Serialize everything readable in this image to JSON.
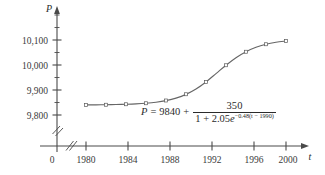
{
  "figure": {
    "title_visible": false,
    "background": "#ffffff",
    "ink_color": "#3a3a3a",
    "curve_color": "#555555"
  },
  "axes": {
    "y": {
      "variable_label": "P",
      "tick_labels": [
        "10,100",
        "10,000",
        "9,900",
        "9,800"
      ],
      "tick_values": [
        10100,
        10000,
        9900,
        9800
      ],
      "has_break_mark": true,
      "has_arrow": true
    },
    "x": {
      "variable_label": "t",
      "tick_labels": [
        "1980",
        "1984",
        "1988",
        "1992",
        "1996",
        "2000"
      ],
      "tick_values": [
        1980,
        1984,
        1988,
        1992,
        1996,
        2000
      ],
      "has_break_mark": true,
      "has_arrow": true
    },
    "origin_label": "0"
  },
  "equation": {
    "lhs": "P",
    "equals": "=",
    "constant": "9840",
    "plus": "+",
    "numerator": "350",
    "denominator_lead": "1 + 2.05",
    "exp_base": "e",
    "exponent": "−0.48(t − 1990)",
    "exponent_coefficient": "−0.48",
    "exponent_variable": "t",
    "exponent_offset": "1990",
    "full_text": "P = 9840 + 350 / (1 + 2.05e^(−0.48(t − 1990)))"
  },
  "chart_data": {
    "type": "line",
    "title": "",
    "xlabel": "t",
    "ylabel": "P",
    "xlim": [
      1979,
      2001
    ],
    "ylim": [
      9760,
      10210
    ],
    "grid": false,
    "legend": "none",
    "xticks": [
      1980,
      1984,
      1988,
      1992,
      1996,
      2000
    ],
    "yticks": [
      9800,
      9900,
      10000,
      10100
    ],
    "series": [
      {
        "name": "logistic model curve",
        "kind": "line",
        "x": [
          1980,
          1981,
          1982,
          1983,
          1984,
          1985,
          1986,
          1987,
          1988,
          1989,
          1990,
          1991,
          1992,
          1993,
          1994,
          1995,
          1996,
          1997,
          1998,
          1999,
          2000
        ],
        "y": [
          9840.4,
          9840.7,
          9841.1,
          9841.8,
          9842.8,
          9844.4,
          9847.0,
          9851.1,
          9857.5,
          9867.5,
          9882.5,
          9903.9,
          9932.2,
          9965.4,
          9999.2,
          10029.3,
          10053.3,
          10070.9,
          10083.0,
          10091.0,
          10096.2
        ]
      },
      {
        "name": "data points",
        "kind": "scatter",
        "x": [
          1980,
          1982,
          1984,
          1986,
          1988,
          1990,
          1992,
          1994,
          1996,
          1998,
          2000
        ],
        "y": [
          9840,
          9841,
          9843,
          9847,
          9858,
          9883,
          9932,
          9999,
          10053,
          10083,
          10096
        ]
      }
    ],
    "annotations": [
      {
        "text": "P = 9840 + 350/(1 + 2.05e^(-0.48(t - 1990)))",
        "x": 1991,
        "y": 9815
      }
    ]
  }
}
